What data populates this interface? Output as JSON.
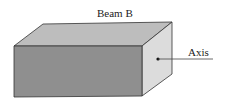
{
  "diagram": {
    "title": "Beam B",
    "axis_label": "Axis",
    "colors": {
      "front_face": "#8f8f8f",
      "top_face": "#bdbdbd",
      "side_face": "#dcdcdc",
      "edge": "#333333"
    }
  }
}
